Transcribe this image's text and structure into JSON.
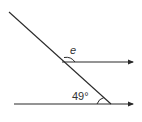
{
  "diagram": {
    "type": "parallel-lines-transversal",
    "labels": {
      "unknown_angle": "e",
      "known_angle": "49°"
    },
    "colors": {
      "line": "#2a2a2a",
      "background": "#ffffff"
    }
  }
}
